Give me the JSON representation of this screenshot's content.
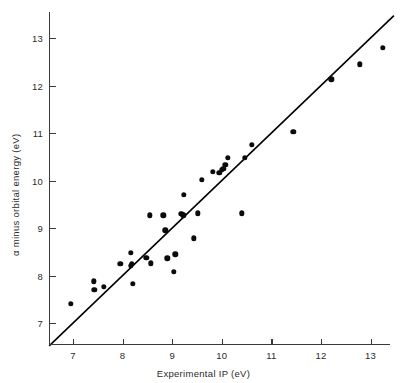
{
  "chart_data": {
    "type": "scatter",
    "title": "",
    "xlabel": "Experimental IP (eV)",
    "ylabel": "α minus orbital energy (eV)",
    "xlim": [
      6.52,
      13.52
    ],
    "ylim": [
      6.56,
      13.44
    ],
    "xticks": [
      7,
      8,
      9,
      10,
      11,
      12,
      13
    ],
    "yticks": [
      7,
      8,
      9,
      10,
      11,
      12,
      13
    ],
    "xtick_labels": [
      "7",
      "8",
      "9",
      "10",
      "11",
      "12",
      "13"
    ],
    "ytick_labels": [
      "7",
      "8",
      "9",
      "10",
      "11",
      "12",
      "13"
    ],
    "grid": false,
    "legend": null,
    "reference_line": {
      "name": "y = x identity line",
      "slope": 1,
      "intercept": 0,
      "x_start": 6.52,
      "x_end": 13.47,
      "color": "#000000"
    },
    "series": [
      {
        "name": "molecules",
        "marker": "filled-circle",
        "color": "#0b0b0b",
        "points": [
          [
            6.96,
            7.41
          ],
          [
            7.42,
            7.88
          ],
          [
            7.43,
            7.7
          ],
          [
            7.62,
            7.76
          ],
          [
            7.95,
            8.25
          ],
          [
            8.16,
            8.48
          ],
          [
            8.18,
            8.25
          ],
          [
            8.17,
            8.21
          ],
          [
            8.2,
            7.82
          ],
          [
            8.48,
            8.37
          ],
          [
            8.55,
            9.27
          ],
          [
            8.57,
            8.26
          ],
          [
            8.82,
            9.27
          ],
          [
            8.86,
            8.95
          ],
          [
            8.9,
            8.36
          ],
          [
            9.03,
            8.08
          ],
          [
            9.06,
            8.45
          ],
          [
            9.18,
            9.3
          ],
          [
            9.22,
            9.27
          ],
          [
            9.23,
            9.7
          ],
          [
            9.44,
            8.78
          ],
          [
            9.52,
            9.31
          ],
          [
            9.6,
            10.02
          ],
          [
            9.82,
            10.18
          ],
          [
            9.95,
            10.16
          ],
          [
            10.0,
            10.22
          ],
          [
            10.03,
            10.24
          ],
          [
            10.07,
            10.33
          ],
          [
            10.12,
            10.48
          ],
          [
            10.4,
            9.31
          ],
          [
            10.46,
            10.48
          ],
          [
            10.6,
            10.75
          ],
          [
            11.44,
            11.02
          ],
          [
            12.21,
            12.13
          ],
          [
            12.78,
            12.45
          ],
          [
            13.25,
            12.8
          ]
        ]
      }
    ]
  },
  "axis_label_color": "#2b2b2b",
  "axis_line_color": "#3a3a3a"
}
